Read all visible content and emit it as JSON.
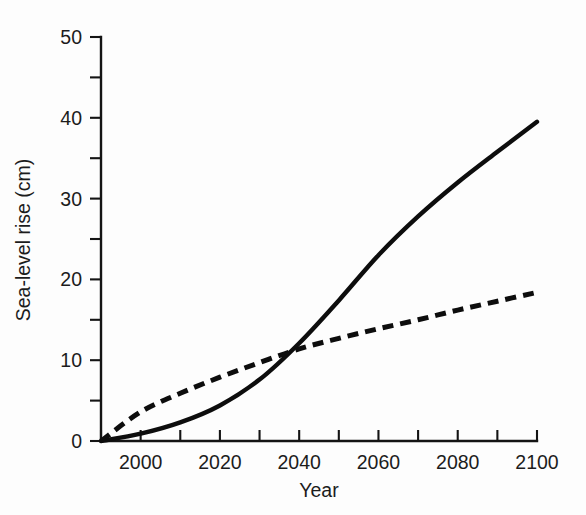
{
  "chart_data": {
    "type": "line",
    "title": "",
    "xlabel": "Year",
    "ylabel": "Sea-level rise (cm)",
    "xlim": [
      1990,
      2100
    ],
    "ylim": [
      0,
      50
    ],
    "grid": false,
    "legend": "none",
    "x_major_ticks": [
      2000,
      2020,
      2040,
      2060,
      2080,
      2100
    ],
    "x_major_tick_labels": [
      "2000",
      "2020",
      "2040",
      "2060",
      "2080",
      "2100"
    ],
    "x_minor_ticks": [
      1990,
      2010,
      2030,
      2050,
      2070,
      2090
    ],
    "y_major_ticks": [
      0,
      10,
      20,
      30,
      40,
      50
    ],
    "y_major_tick_labels": [
      "0",
      "10",
      "20",
      "30",
      "40",
      "50"
    ],
    "y_minor_ticks": [
      5,
      15,
      25,
      35,
      45
    ],
    "x": [
      1990,
      2000,
      2010,
      2020,
      2030,
      2040,
      2050,
      2060,
      2070,
      2080,
      2090,
      2100
    ],
    "series": [
      {
        "name": "accelerating-scenario",
        "style": "solid",
        "color": "#0d0d0d",
        "values": [
          0.0,
          0.9,
          2.3,
          4.4,
          7.6,
          12.1,
          17.4,
          23.0,
          27.8,
          32.0,
          35.8,
          39.5
        ]
      },
      {
        "name": "linear-scenario",
        "style": "dashed",
        "color": "#0d0d0d",
        "values": [
          0.0,
          3.6,
          5.9,
          7.9,
          9.7,
          11.4,
          12.7,
          13.9,
          15.0,
          16.2,
          17.3,
          18.4
        ]
      }
    ],
    "annotations": [
      {
        "label": "curves-cross",
        "x": 2040,
        "y": 12.1
      }
    ]
  },
  "axes": {
    "y_title": "Sea-level rise (cm)",
    "x_title": "Year"
  }
}
